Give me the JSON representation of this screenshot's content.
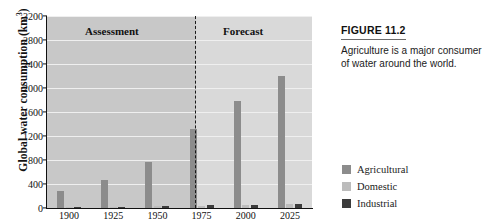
{
  "figure": {
    "number_label": "FIGURE 11.2",
    "caption": "Agriculture is a major consumer of water around the world."
  },
  "legend": {
    "position": "right",
    "items": [
      {
        "label": "Agricultural",
        "color": "#8c8c8c"
      },
      {
        "label": "Domestic",
        "color": "#bcbcbc"
      },
      {
        "label": "Industrial",
        "color": "#3c3c3c"
      }
    ]
  },
  "chart_data": {
    "type": "bar",
    "title": "",
    "xlabel": "",
    "ylabel": "Global water consumption (km3)",
    "ylabel_base": "Global water consumption (km",
    "ylabel_sup": "3",
    "ylabel_tail": ")",
    "categories": [
      "1900",
      "1925",
      "1950",
      "1975",
      "2000",
      "2025"
    ],
    "series": [
      {
        "name": "Agricultural",
        "color": "#8c8c8c",
        "values": [
          290,
          460,
          770,
          1320,
          1780,
          2200
        ]
      },
      {
        "name": "Domestic",
        "color": "#bcbcbc",
        "values": [
          15,
          20,
          30,
          40,
          55,
          75
        ]
      },
      {
        "name": "Industrial",
        "color": "#3c3c3c",
        "values": [
          20,
          25,
          35,
          45,
          50,
          60
        ]
      }
    ],
    "ylim": [
      0,
      3200
    ],
    "ytick_step": 400,
    "yticks": [
      "0",
      "400",
      "800",
      "1200",
      "1600",
      "2000",
      "2400",
      "2800",
      "3200"
    ],
    "grid": true,
    "grid_color": "#efefef",
    "regions": [
      {
        "label": "Assessment",
        "start_category": "1900",
        "end_category": "1975",
        "background": "#c8c8c8"
      },
      {
        "label": "Forecast",
        "start_category": "2000",
        "end_category": "2025",
        "background": "#d9d9d9"
      }
    ],
    "divider": {
      "style": "dashed",
      "between": [
        "1975",
        "2000"
      ],
      "color": "#1a1a1a"
    }
  }
}
